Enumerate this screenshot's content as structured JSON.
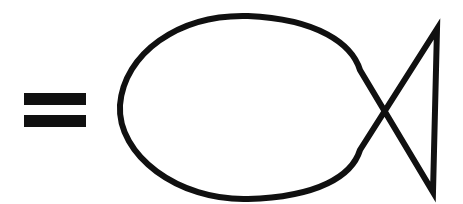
{
  "figure": {
    "background_color": "#ffffff",
    "ink_color": "#101010",
    "stroke_width": 6,
    "canvas": {
      "width": 463,
      "height": 204
    },
    "style": "hand-drawn monochrome line art",
    "alt_text": "A thick black equals sign on the left, and to its right a large outline drawing of a fish made of an oval body and a triangular tail."
  },
  "elements": {
    "equals_sign": {
      "name": "equals-sign",
      "glyph": "=",
      "color": "#101010",
      "bars": [
        {
          "label": "equals-bar-top",
          "x": 24,
          "y": 93,
          "width": 62,
          "height": 12
        },
        {
          "label": "equals-bar-bottom",
          "x": 24,
          "y": 115,
          "width": 62,
          "height": 12
        }
      ]
    },
    "fish": {
      "name": "fish-outline",
      "color": "#101010",
      "fill": "none",
      "stroke_width": 6,
      "body": {
        "label": "fish-body-oval",
        "leftmost_point": {
          "x": 120,
          "y": 105
        },
        "top_point": {
          "x": 248,
          "y": 16
        },
        "bottom_point": {
          "x": 248,
          "y": 199
        },
        "right_top_junction": {
          "x": 360,
          "y": 70
        },
        "right_bottom_junction": {
          "x": 360,
          "y": 150
        }
      },
      "tail": {
        "label": "fish-tail-triangle",
        "notch_top": {
          "x": 360,
          "y": 70
        },
        "notch_bottom": {
          "x": 360,
          "y": 150
        },
        "corner_top_right": {
          "x": 437,
          "y": 29
        },
        "corner_bottom_right": {
          "x": 433,
          "y": 192
        }
      },
      "path": "M 360 70 C 352 44 318 19 248 16 C 178 14 124 54 120 105 C 117 155 178 201 248 199 C 318 197 352 176 360 150 L 437 29 L 433 192 Z"
    }
  }
}
